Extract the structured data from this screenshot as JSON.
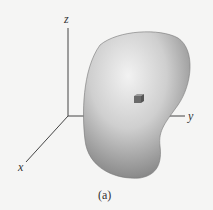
{
  "figure": {
    "axes": {
      "x_label": "x",
      "y_label": "y",
      "z_label": "z"
    },
    "caption": "(a)",
    "elements": [
      "3d-body",
      "volume-element-cube",
      "axes"
    ]
  }
}
